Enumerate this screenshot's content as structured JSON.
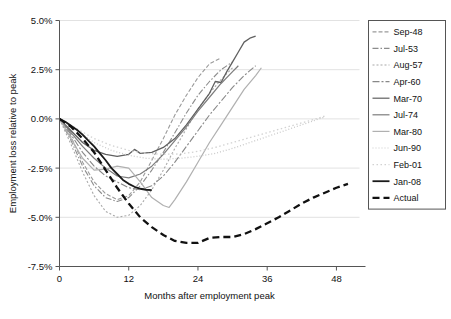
{
  "chart_data": {
    "type": "line",
    "title": "",
    "xlabel": "Months after employment peak",
    "ylabel": "Employment loss relative to peak",
    "xlim": [
      0,
      52
    ],
    "ylim": [
      -7.5,
      5.0
    ],
    "xticks": [
      0,
      12,
      24,
      36,
      48
    ],
    "xtick_labels": [
      "0",
      "12",
      "24",
      "36",
      "48"
    ],
    "yticks": [
      5.0,
      2.5,
      0.0,
      -2.5,
      -5.0,
      -7.5
    ],
    "ytick_labels": [
      "5.0%",
      "2.5%",
      "0.0%",
      "-2.5%",
      "-5.0%",
      "-7.5%"
    ],
    "grid": true,
    "legend_position": "right-outside",
    "series": [
      {
        "name": "Sep-48",
        "color": "#9a9a9a",
        "dash": "4,2",
        "width": 1.1,
        "points": [
          [
            0,
            0
          ],
          [
            2,
            -0.9
          ],
          [
            4,
            -2.2
          ],
          [
            6,
            -3.2
          ],
          [
            8,
            -3.8
          ],
          [
            10,
            -4.1
          ],
          [
            12,
            -3.9
          ],
          [
            14,
            -3.2
          ],
          [
            16,
            -2.1
          ],
          [
            18,
            -1.0
          ],
          [
            20,
            0.2
          ],
          [
            22,
            1.2
          ],
          [
            24,
            2.1
          ],
          [
            26,
            2.8
          ],
          [
            28,
            3.1
          ]
        ]
      },
      {
        "name": "Jul-53",
        "color": "#8c8c8c",
        "dash": "6,2,1.5,2",
        "width": 1.1,
        "points": [
          [
            0,
            0
          ],
          [
            2,
            -1.1
          ],
          [
            4,
            -2.4
          ],
          [
            6,
            -3.4
          ],
          [
            8,
            -4.0
          ],
          [
            10,
            -4.2
          ],
          [
            12,
            -4.0
          ],
          [
            14,
            -3.4
          ],
          [
            16,
            -2.6
          ],
          [
            18,
            -1.7
          ],
          [
            20,
            -0.7
          ],
          [
            22,
            0.3
          ],
          [
            24,
            1.2
          ],
          [
            26,
            1.9
          ],
          [
            28,
            2.5
          ],
          [
            30,
            2.9
          ]
        ]
      },
      {
        "name": "Aug-57",
        "color": "#a8a8a8",
        "dash": "2,2",
        "width": 1.1,
        "points": [
          [
            0,
            0
          ],
          [
            2,
            -1.3
          ],
          [
            4,
            -2.7
          ],
          [
            6,
            -3.9
          ],
          [
            8,
            -4.7
          ],
          [
            10,
            -5.0
          ],
          [
            12,
            -4.9
          ],
          [
            14,
            -4.4
          ],
          [
            16,
            -3.6
          ],
          [
            18,
            -2.6
          ],
          [
            20,
            -1.5
          ],
          [
            22,
            -0.5
          ],
          [
            24,
            0.5
          ],
          [
            26,
            1.3
          ],
          [
            28,
            2.0
          ],
          [
            30,
            2.6
          ]
        ]
      },
      {
        "name": "Apr-60",
        "color": "#888888",
        "dash": "7,2,2,2",
        "width": 1.1,
        "points": [
          [
            0,
            0
          ],
          [
            2,
            -0.8
          ],
          [
            4,
            -1.7
          ],
          [
            6,
            -2.4
          ],
          [
            8,
            -2.9
          ],
          [
            10,
            -3.2
          ],
          [
            12,
            -3.5
          ],
          [
            14,
            -3.6
          ],
          [
            16,
            -3.4
          ],
          [
            18,
            -2.9
          ],
          [
            20,
            -2.2
          ],
          [
            22,
            -1.4
          ],
          [
            24,
            -0.6
          ],
          [
            26,
            0.2
          ],
          [
            28,
            0.9
          ],
          [
            30,
            1.6
          ],
          [
            32,
            2.2
          ],
          [
            34,
            2.7
          ]
        ]
      },
      {
        "name": "Mar-70",
        "color": "#606060",
        "dash": "none",
        "width": 1.3,
        "points": [
          [
            0,
            0
          ],
          [
            2,
            -0.6
          ],
          [
            4,
            -1.2
          ],
          [
            6,
            -1.6
          ],
          [
            8,
            -1.8
          ],
          [
            10,
            -1.9
          ],
          [
            12,
            -1.8
          ],
          [
            13,
            -1.55
          ],
          [
            14,
            -1.75
          ],
          [
            16,
            -1.7
          ],
          [
            18,
            -1.45
          ],
          [
            20,
            -1.0
          ],
          [
            22,
            -0.3
          ],
          [
            24,
            0.5
          ],
          [
            26,
            1.3
          ],
          [
            27,
            1.9
          ],
          [
            28,
            1.85
          ],
          [
            29,
            2.4
          ],
          [
            30,
            2.9
          ],
          [
            31,
            3.4
          ],
          [
            32,
            3.9
          ],
          [
            33,
            4.1
          ],
          [
            34,
            4.2
          ]
        ]
      },
      {
        "name": "Jul-74",
        "color": "#7d7d7d",
        "dash": "none",
        "width": 1.2,
        "points": [
          [
            0,
            0
          ],
          [
            2,
            -0.7
          ],
          [
            4,
            -1.4
          ],
          [
            6,
            -2.0
          ],
          [
            8,
            -2.5
          ],
          [
            10,
            -2.9
          ],
          [
            12,
            -3.0
          ],
          [
            14,
            -2.8
          ],
          [
            16,
            -2.4
          ],
          [
            18,
            -1.8
          ],
          [
            20,
            -1.1
          ],
          [
            22,
            -0.4
          ],
          [
            24,
            0.4
          ],
          [
            26,
            1.1
          ],
          [
            28,
            1.8
          ],
          [
            30,
            2.4
          ],
          [
            31,
            2.7
          ]
        ]
      },
      {
        "name": "Mar-80",
        "color": "#b0b0b0",
        "dash": "none",
        "width": 1.2,
        "points": [
          [
            0,
            0
          ],
          [
            2,
            -1.0
          ],
          [
            4,
            -2.0
          ],
          [
            6,
            -2.6
          ],
          [
            8,
            -2.55
          ],
          [
            10,
            -2.4
          ],
          [
            12,
            -2.5
          ],
          [
            14,
            -3.2
          ],
          [
            16,
            -4.0
          ],
          [
            18,
            -4.4
          ],
          [
            19,
            -4.5
          ],
          [
            20,
            -4.1
          ],
          [
            22,
            -3.2
          ],
          [
            24,
            -2.2
          ],
          [
            26,
            -1.2
          ],
          [
            28,
            -0.3
          ],
          [
            30,
            0.6
          ],
          [
            32,
            1.5
          ],
          [
            34,
            2.2
          ],
          [
            35,
            2.6
          ]
        ]
      },
      {
        "name": "Jun-90",
        "color": "#c9c9c9",
        "dash": "1,2",
        "width": 1.3,
        "points": [
          [
            0,
            0
          ],
          [
            3,
            -0.6
          ],
          [
            6,
            -1.2
          ],
          [
            9,
            -1.6
          ],
          [
            12,
            -1.85
          ],
          [
            15,
            -2.0
          ],
          [
            18,
            -2.05
          ],
          [
            21,
            -2.0
          ],
          [
            24,
            -1.9
          ],
          [
            27,
            -1.75
          ],
          [
            30,
            -1.5
          ],
          [
            33,
            -1.2
          ],
          [
            36,
            -0.9
          ],
          [
            39,
            -0.6
          ],
          [
            42,
            -0.3
          ],
          [
            45,
            0.0
          ],
          [
            46,
            0.1
          ]
        ]
      },
      {
        "name": "Feb-01",
        "color": "#d2d2d2",
        "dash": "1.5,2.5",
        "width": 1.3,
        "points": [
          [
            0,
            0
          ],
          [
            3,
            -0.5
          ],
          [
            6,
            -1.0
          ],
          [
            9,
            -1.35
          ],
          [
            12,
            -1.6
          ],
          [
            15,
            -1.75
          ],
          [
            18,
            -1.8
          ],
          [
            21,
            -1.78
          ],
          [
            24,
            -1.65
          ],
          [
            27,
            -1.45
          ],
          [
            30,
            -1.2
          ],
          [
            33,
            -0.95
          ],
          [
            36,
            -0.7
          ],
          [
            39,
            -0.45
          ],
          [
            42,
            -0.2
          ],
          [
            45,
            0.05
          ],
          [
            46,
            0.15
          ]
        ]
      },
      {
        "name": "Jan-08",
        "color": "#1a1a1a",
        "dash": "none",
        "width": 1.8,
        "points": [
          [
            0,
            0
          ],
          [
            1,
            -0.15
          ],
          [
            2,
            -0.35
          ],
          [
            3,
            -0.55
          ],
          [
            4,
            -0.8
          ],
          [
            5,
            -1.1
          ],
          [
            6,
            -1.4
          ],
          [
            7,
            -1.75
          ],
          [
            8,
            -2.1
          ],
          [
            9,
            -2.5
          ],
          [
            10,
            -2.8
          ],
          [
            11,
            -3.1
          ],
          [
            12,
            -3.3
          ],
          [
            13,
            -3.45
          ],
          [
            14,
            -3.55
          ],
          [
            15,
            -3.6
          ],
          [
            16,
            -3.62
          ]
        ]
      },
      {
        "name": "Actual",
        "color": "#111111",
        "dash": "7,4",
        "width": 2.3,
        "points": [
          [
            0,
            0
          ],
          [
            2,
            -0.4
          ],
          [
            4,
            -1.0
          ],
          [
            6,
            -1.7
          ],
          [
            8,
            -2.6
          ],
          [
            10,
            -3.5
          ],
          [
            12,
            -4.3
          ],
          [
            14,
            -5.0
          ],
          [
            16,
            -5.5
          ],
          [
            18,
            -5.9
          ],
          [
            20,
            -6.2
          ],
          [
            22,
            -6.3
          ],
          [
            24,
            -6.3
          ],
          [
            26,
            -6.05
          ],
          [
            28,
            -6.0
          ],
          [
            30,
            -6.0
          ],
          [
            32,
            -5.85
          ],
          [
            34,
            -5.6
          ],
          [
            36,
            -5.3
          ],
          [
            38,
            -5.0
          ],
          [
            40,
            -4.65
          ],
          [
            42,
            -4.3
          ],
          [
            44,
            -4.0
          ],
          [
            46,
            -3.75
          ],
          [
            48,
            -3.5
          ],
          [
            50,
            -3.3
          ]
        ]
      }
    ]
  },
  "legend": {
    "entries": [
      {
        "label": "Sep-48"
      },
      {
        "label": "Jul-53"
      },
      {
        "label": "Aug-57"
      },
      {
        "label": "Apr-60"
      },
      {
        "label": "Mar-70"
      },
      {
        "label": "Jul-74"
      },
      {
        "label": "Mar-80"
      },
      {
        "label": "Jun-90"
      },
      {
        "label": "Feb-01"
      },
      {
        "label": "Jan-08"
      },
      {
        "label": "Actual"
      }
    ]
  }
}
